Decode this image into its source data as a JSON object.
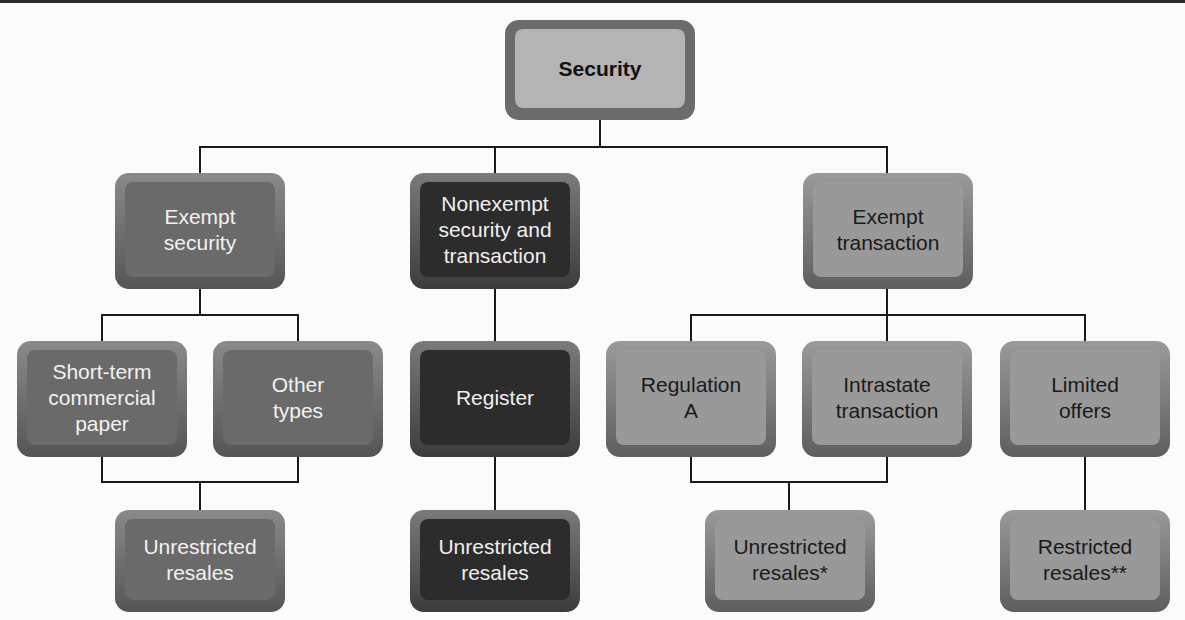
{
  "diagram": {
    "root": {
      "label": "Security"
    },
    "level1": [
      {
        "label": "Exempt\nsecurity"
      },
      {
        "label": "Nonexempt\nsecurity and\ntransaction"
      },
      {
        "label": "Exempt\ntransaction"
      }
    ],
    "exempt_security_children": [
      {
        "label": "Short-term\ncommercial\npaper"
      },
      {
        "label": "Other\ntypes"
      }
    ],
    "exempt_security_result": {
      "label": "Unrestricted\nresales"
    },
    "nonexempt_children": [
      {
        "label": "Register"
      }
    ],
    "nonexempt_result": {
      "label": "Unrestricted\nresales"
    },
    "exempt_transaction_children": [
      {
        "label": "Regulation\nA"
      },
      {
        "label": "Intrastate\ntransaction"
      },
      {
        "label": "Limited\noffers"
      }
    ],
    "exempt_transaction_results": [
      {
        "label": "Unrestricted\nresales*"
      },
      {
        "label": "Restricted\nresales**"
      }
    ]
  }
}
